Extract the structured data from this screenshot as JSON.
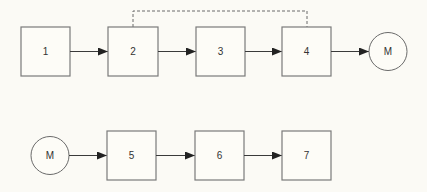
{
  "diagram": {
    "row1": {
      "boxes": [
        {
          "id": "1",
          "label": "1"
        },
        {
          "id": "2",
          "label": "2"
        },
        {
          "id": "3",
          "label": "3"
        },
        {
          "id": "4",
          "label": "4"
        }
      ],
      "motor": {
        "label": "M"
      },
      "feedback": {
        "from": "4",
        "to": "2",
        "style": "dashed"
      }
    },
    "row2": {
      "motor": {
        "label": "M"
      },
      "boxes": [
        {
          "id": "5",
          "label": "5"
        },
        {
          "id": "6",
          "label": "6"
        },
        {
          "id": "7",
          "label": "7"
        }
      ]
    },
    "edges": [
      {
        "from": "1",
        "to": "2"
      },
      {
        "from": "2",
        "to": "3"
      },
      {
        "from": "3",
        "to": "4"
      },
      {
        "from": "4",
        "to": "M-top"
      },
      {
        "from": "M-bottom",
        "to": "5"
      },
      {
        "from": "5",
        "to": "6"
      },
      {
        "from": "6",
        "to": "7"
      }
    ]
  }
}
